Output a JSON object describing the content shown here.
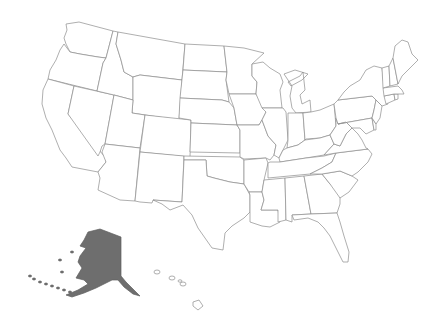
{
  "map": {
    "title": "",
    "colors": {
      "default_fill": "#ffffff",
      "highlight_fill": "#6e6e6e",
      "border": "#8c8c8c",
      "background": "#ffffff"
    },
    "highlighted_states": [
      "Alaska"
    ],
    "states": [
      {
        "id": "WA",
        "name": "Washington",
        "pts": "66,24 79,22 113,31 106,58 98,57 80,54 70,52 66,44 64,38 67,30"
      },
      {
        "id": "OR",
        "name": "Oregon",
        "pts": "64,44 70,52 80,54 98,57 106,58 103,63 97,91 48,79 50,70 56,60 60,50"
      },
      {
        "id": "CA",
        "name": "California",
        "pts": "48,79 74,86 68,114 105,157 106,162 98,172 72,167 66,158 60,150 52,130 46,118 42,104 43,90"
      },
      {
        "id": "NV",
        "name": "Nevada",
        "pts": "74,86 114,95 105,144 102,146 100,152 98,156 68,114"
      },
      {
        "id": "ID",
        "name": "Idaho",
        "pts": "113,31 118,32 116,44 121,60 124,72 133,77 133,100 114,95 97,91 103,63 106,58"
      },
      {
        "id": "MT",
        "name": "Montana",
        "pts": "118,32 185,44 182,80 140,75 133,77 124,72 121,60 116,44"
      },
      {
        "id": "WY",
        "name": "Wyoming",
        "pts": "140,75 182,80 179,120 132,113 133,100 133,77"
      },
      {
        "id": "UT",
        "name": "Utah",
        "pts": "114,95 133,100 132,113 145,115 140,148 105,144"
      },
      {
        "id": "AZ",
        "name": "Arizona",
        "pts": "105,144 140,148 135,201 120,200 98,190 100,178 98,172 106,162 102,152"
      },
      {
        "id": "CO",
        "name": "Colorado",
        "pts": "145,115 191,120 190,157 140,152"
      },
      {
        "id": "NM",
        "name": "New Mexico",
        "pts": "140,152 184,156 182,202 153,200 152,203 140,202 135,201"
      },
      {
        "id": "ND",
        "name": "North Dakota",
        "pts": "185,44 224,46 227,72 183,70"
      },
      {
        "id": "SD",
        "name": "South Dakota",
        "pts": "183,70 227,72 226,80 229,102 222,100 180,98"
      },
      {
        "id": "NE",
        "name": "Nebraska",
        "pts": "180,98 222,100 229,102 234,108 237,125 191,123 191,120 179,118"
      },
      {
        "id": "KS",
        "name": "Kansas",
        "pts": "191,123 237,125 240,130 240,153 190,152"
      },
      {
        "id": "OK",
        "name": "Oklahoma",
        "pts": "184,156 240,157 244,160 244,184 230,182 214,178 207,176 206,160 184,160"
      },
      {
        "id": "TX",
        "name": "Texas",
        "pts": "184,160 206,160 207,176 214,178 230,182 244,184 250,195 250,212 244,218 232,226 225,233 223,250 212,248 205,238 198,228 192,215 183,205 170,210 162,204 153,200 182,202"
      },
      {
        "id": "MN",
        "name": "Minnesota",
        "pts": "224,46 244,48 264,53 252,64 252,76 257,82 256,94 229,94 226,80 227,72"
      },
      {
        "id": "IA",
        "name": "Iowa",
        "pts": "229,94 256,94 262,102 266,112 262,120 259,125 237,125 234,108"
      },
      {
        "id": "MO",
        "name": "Missouri",
        "pts": "237,125 259,125 262,120 268,136 276,145 274,155 270,160 266,158 244,159 240,157 240,130"
      },
      {
        "id": "AR",
        "name": "Arkansas",
        "pts": "244,160 266,158 268,163 264,180 262,192 249,192 244,184"
      },
      {
        "id": "LA",
        "name": "Louisiana",
        "pts": "249,192 262,192 264,200 261,210 278,210 280,222 270,227 262,226 250,222 250,212 250,195"
      },
      {
        "id": "WI",
        "name": "Wisconsin",
        "pts": "252,64 263,62 270,68 280,74 283,82 280,90 282,108 262,108 256,94 257,82 252,76"
      },
      {
        "id": "IL",
        "name": "Illinois",
        "pts": "262,108 283,108 286,112 288,140 283,150 279,158 274,155 276,145 268,136 262,120 266,112"
      },
      {
        "id": "MI",
        "name": "Michigan",
        "pts": "284,74 295,70 308,74 302,80 291,86 288,82 300,76 303,72 305,90 300,95 302,104 310,100 311,112 296,113 292,108 290,96 292,86"
      },
      {
        "id": "IN",
        "name": "Indiana",
        "pts": "288,113 303,113 305,140 298,145 287,148 288,140"
      },
      {
        "id": "OH",
        "name": "Ohio",
        "pts": "303,113 311,112 320,110 334,104 336,126 330,135 320,138 306,139 305,140"
      },
      {
        "id": "KY",
        "name": "Kentucky",
        "pts": "283,150 287,148 298,145 305,140 320,138 330,135 334,144 324,155 306,158 280,162 279,158"
      },
      {
        "id": "TN",
        "name": "Tennessee",
        "pts": "270,162 280,162 306,158 324,156 336,153 332,162 322,168 310,174 268,178 268,163"
      },
      {
        "id": "MS",
        "name": "Mississippi",
        "pts": "264,180 285,178 286,220 278,222 278,210 261,210 264,200 262,192"
      },
      {
        "id": "AL",
        "name": "Alabama",
        "pts": "285,178 304,176 311,214 292,215 292,222 286,220"
      },
      {
        "id": "GA",
        "name": "Georgia",
        "pts": "304,176 322,174 330,184 340,194 340,204 337,213 311,214"
      },
      {
        "id": "FL",
        "name": "Florida",
        "pts": "292,215 311,214 337,213 340,222 344,236 349,252 348,262 343,262 336,248 330,236 324,228 318,222 308,218 294,220"
      },
      {
        "id": "SC",
        "name": "South Carolina",
        "pts": "322,174 340,171 352,176 358,180 349,192 340,198 330,184"
      },
      {
        "id": "NC",
        "name": "North Carolina",
        "pts": "336,153 368,149 372,154 368,162 358,172 352,176 340,171 322,174 310,174 322,168 332,162"
      },
      {
        "id": "VA",
        "name": "Virginia",
        "pts": "324,155 334,144 340,146 346,134 352,128 358,134 362,140 366,148 368,149 336,153"
      },
      {
        "id": "WV",
        "name": "West Virginia",
        "pts": "330,135 336,126 336,118 338,124 346,122 352,128 346,134 340,146 334,144"
      },
      {
        "id": "PA",
        "name": "Pennsylvania",
        "pts": "334,104 338,100 372,96 376,100 374,110 372,118 338,124 336,118"
      },
      {
        "id": "NY",
        "name": "New York",
        "pts": "338,100 344,92 350,86 360,80 366,70 374,66 382,68 384,86 386,98 388,104 382,106 376,100 372,96"
      },
      {
        "id": "MD",
        "name": "Maryland",
        "pts": "338,124 372,118 374,130 366,134 360,128 352,128 346,122"
      },
      {
        "id": "DE",
        "name": "Delaware",
        "pts": "372,118 376,124 376,130 374,130"
      },
      {
        "id": "NJ",
        "name": "New Jersey",
        "pts": "376,100 382,106 380,118 376,124 372,118 374,110"
      },
      {
        "id": "CT",
        "name": "Connecticut",
        "pts": "384,96 394,94 395,100 386,104"
      },
      {
        "id": "RI",
        "name": "Rhode Island",
        "pts": "394,94 398,94 398,99 395,100"
      },
      {
        "id": "MA",
        "name": "Massachusetts",
        "pts": "383,88 398,86 402,90 404,94 398,94 394,94 384,96"
      },
      {
        "id": "VT",
        "name": "Vermont",
        "pts": "382,68 389,66 390,86 383,88"
      },
      {
        "id": "NH",
        "name": "New Hampshire",
        "pts": "389,66 393,58 398,84 390,86"
      },
      {
        "id": "ME",
        "name": "Maine",
        "pts": "393,58 395,46 402,40 408,42 412,54 418,60 410,68 402,76 398,84"
      },
      {
        "id": "AK",
        "name": "Alaska",
        "pts": "88,232 100,229 121,237 121,276 126,282 132,288 140,296 133,294 124,287 118,280 112,280 104,284 96,288 84,293 72,297 66,295 78,290 88,284 84,280 76,278 82,268 78,262 80,256 86,248 80,246 84,240"
      },
      {
        "id": "HI",
        "name": "Hawaii",
        "pts": "193,302 199,300 203,306 198,310 193,306"
      }
    ],
    "islands": [
      {
        "name": "Hawaii-Kauai",
        "cx": 157,
        "cy": 272,
        "rx": 3,
        "ry": 2
      },
      {
        "name": "Hawaii-Oahu",
        "cx": 172,
        "cy": 278,
        "rx": 3,
        "ry": 2
      },
      {
        "name": "Hawaii-Maui",
        "cx": 183,
        "cy": 284,
        "rx": 3,
        "ry": 2
      },
      {
        "name": "Hawaii-Molokai",
        "cx": 180,
        "cy": 281,
        "rx": 2,
        "ry": 1.2
      }
    ]
  }
}
